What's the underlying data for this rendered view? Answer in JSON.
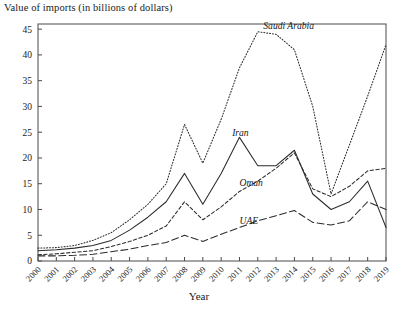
{
  "chart_data": {
    "type": "line",
    "title": "",
    "ylabel": "Value of imports (in billions of dollars)",
    "xlabel": "Year",
    "categories": [
      "2000",
      "2001",
      "2002",
      "2003",
      "2004",
      "2005",
      "2006",
      "2007",
      "2008",
      "2009",
      "2010",
      "2011",
      "2012",
      "2013",
      "2014",
      "2015",
      "2016",
      "2017",
      "2018",
      "2019"
    ],
    "x": [
      2000,
      2001,
      2002,
      2003,
      2004,
      2005,
      2006,
      2007,
      2008,
      2009,
      2010,
      2011,
      2012,
      2013,
      2014,
      2015,
      2016,
      2017,
      2018,
      2019
    ],
    "ylim": [
      0,
      46
    ],
    "xlim": [
      2000,
      2019
    ],
    "yticks": [
      0,
      5,
      10,
      15,
      20,
      25,
      30,
      35,
      40,
      45
    ],
    "ytick_labels": [
      "0",
      "5",
      "10",
      "15",
      "20",
      "25",
      "30",
      "35",
      "40",
      "45"
    ],
    "grid": false,
    "legend": "inline-labels",
    "series": [
      {
        "name": "Saudi Arabia",
        "style": "dotted",
        "label_x": 2012.3,
        "label_y": 45.0,
        "values": [
          2.5,
          2.6,
          3.0,
          4.0,
          5.5,
          8.0,
          11.0,
          15.0,
          26.5,
          19.0,
          27.5,
          37.5,
          44.5,
          44.0,
          41.0,
          30.0,
          13.0,
          22.5,
          32.0,
          42.0
        ]
      },
      {
        "name": "Iran",
        "style": "solid",
        "label_x": 2010.6,
        "label_y": 24.3,
        "values": [
          2.0,
          2.2,
          2.5,
          3.0,
          4.0,
          6.0,
          8.5,
          11.5,
          17.0,
          11.0,
          17.0,
          24.0,
          18.5,
          18.5,
          21.5,
          13.0,
          10.0,
          11.5,
          15.5,
          6.5
        ]
      },
      {
        "name": "Oman",
        "style": "dashed-short",
        "label_x": 2011.0,
        "label_y": 14.5,
        "values": [
          1.2,
          1.4,
          1.7,
          2.0,
          2.8,
          3.8,
          5.0,
          6.8,
          11.5,
          8.0,
          10.5,
          13.5,
          15.5,
          18.0,
          21.0,
          14.0,
          12.5,
          14.5,
          17.5,
          18.0
        ]
      },
      {
        "name": "UAE",
        "style": "dashed-long",
        "label_x": 2011.0,
        "label_y": 7.2,
        "values": [
          1.0,
          1.0,
          1.1,
          1.3,
          1.8,
          2.3,
          3.0,
          3.6,
          5.0,
          3.8,
          5.2,
          6.5,
          7.8,
          8.8,
          9.8,
          7.5,
          7.0,
          7.8,
          11.5,
          10.0
        ]
      }
    ]
  }
}
